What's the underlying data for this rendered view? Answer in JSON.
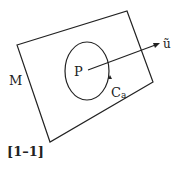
{
  "labels": {
    "manifold": "M",
    "point": "P",
    "curve": "C",
    "curve_sub": "a",
    "vector": "ũ",
    "figure": "[1–1]"
  }
}
